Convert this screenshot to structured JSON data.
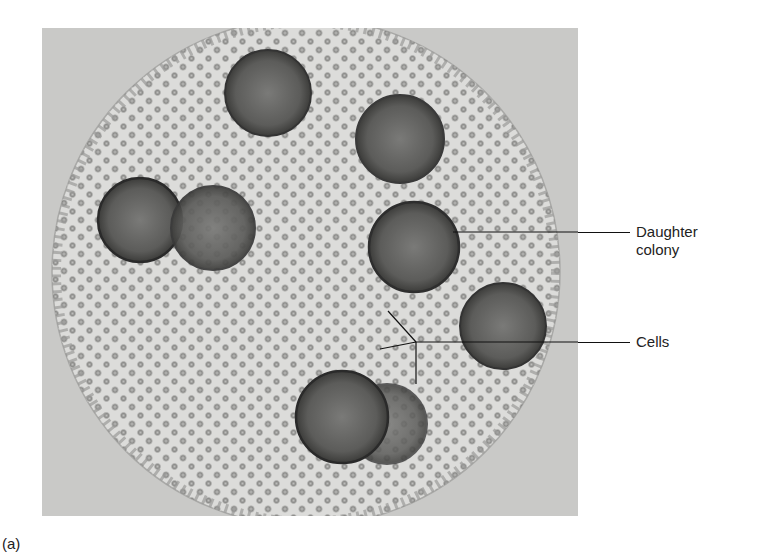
{
  "figure": {
    "caption_letter": "(a)",
    "background_color": "#c9c9c7",
    "colony_color": "#dcdcda",
    "daughter_colony_color": "#555555",
    "cell_color": "#8a8a88"
  },
  "labels": {
    "daughter_colony_line1": "Daughter",
    "daughter_colony_line2": "colony",
    "cells": "Cells"
  },
  "daughter_colonies": [
    {
      "cx": 226,
      "cy": 65,
      "r": 43
    },
    {
      "cx": 358,
      "cy": 111,
      "r": 44
    },
    {
      "cx": 98,
      "cy": 192,
      "r": 42
    },
    {
      "cx": 171,
      "cy": 200,
      "r": 42
    },
    {
      "cx": 372,
      "cy": 219,
      "r": 45
    },
    {
      "cx": 461,
      "cy": 298,
      "r": 43
    },
    {
      "cx": 300,
      "cy": 389,
      "r": 46
    },
    {
      "cx": 345,
      "cy": 396,
      "r": 40
    }
  ]
}
